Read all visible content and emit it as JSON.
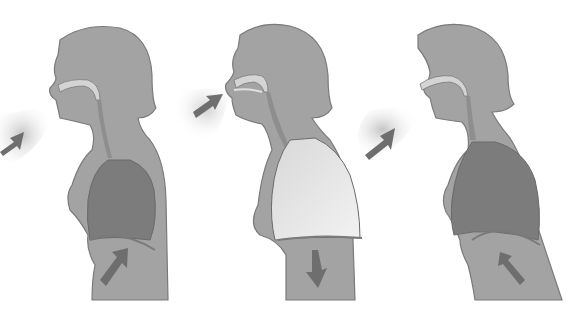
{
  "diagram": {
    "type": "breathing-cycle-illustration",
    "panels": [
      {
        "id": "exhale-1",
        "airflow": "out",
        "lungs": "deflated",
        "diaphragm_arrow": "up"
      },
      {
        "id": "inhale",
        "airflow": "in",
        "lungs": "inflated",
        "diaphragm_arrow": "down"
      },
      {
        "id": "exhale-2",
        "airflow": "out",
        "lungs": "deflated",
        "diaphragm_arrow": "up"
      }
    ],
    "colors": {
      "body": "#a3a3a3",
      "outline": "#7a7a7a",
      "lung_dark": "#7c7c7c",
      "lung_light": "#e6e6e6",
      "arrow": "#6e6e6e",
      "air": "#c8c8c8",
      "airway_light": "#d4d4d4",
      "background": "#ffffff"
    }
  }
}
